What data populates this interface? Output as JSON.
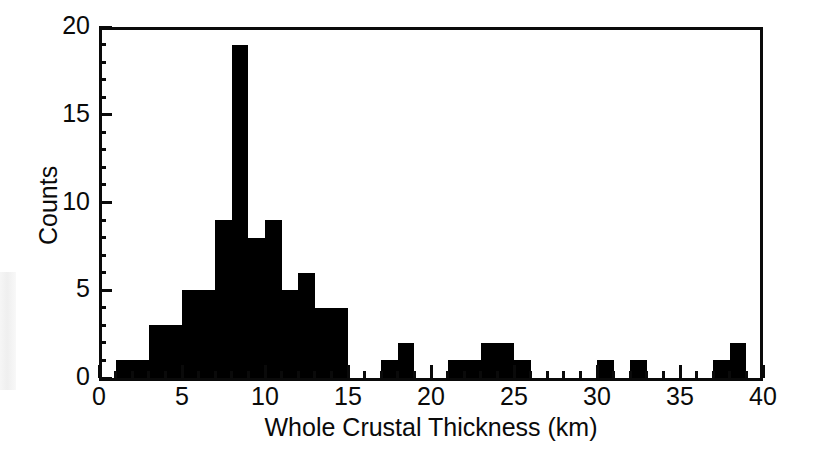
{
  "chart_data": {
    "type": "bar",
    "title": "",
    "subtitle": "",
    "xlabel": "Whole Crustal Thickness (km)",
    "ylabel": "Counts",
    "xlim": [
      0,
      40
    ],
    "ylim": [
      0,
      20
    ],
    "grid": false,
    "legend": null,
    "bin_width": 1,
    "bar_color": "#000000",
    "axis_color": "#000000",
    "background": "#ffffff",
    "xticks_major": [
      0,
      5,
      10,
      15,
      20,
      25,
      30,
      35,
      40
    ],
    "xtick_labels": [
      "0",
      "5",
      "10",
      "15",
      "20",
      "25",
      "30",
      "35",
      "40"
    ],
    "xticks_minor_step": 1,
    "yticks_major": [
      0,
      5,
      10,
      15,
      20
    ],
    "ytick_labels": [
      "0",
      "5",
      "10",
      "15",
      "20"
    ],
    "yticks_minor_step": 1,
    "bins": [
      {
        "x0": 1,
        "x1": 2,
        "value": 1
      },
      {
        "x0": 2,
        "x1": 3,
        "value": 1
      },
      {
        "x0": 3,
        "x1": 4,
        "value": 3
      },
      {
        "x0": 4,
        "x1": 5,
        "value": 3
      },
      {
        "x0": 5,
        "x1": 6,
        "value": 5
      },
      {
        "x0": 6,
        "x1": 7,
        "value": 5
      },
      {
        "x0": 7,
        "x1": 8,
        "value": 9
      },
      {
        "x0": 8,
        "x1": 9,
        "value": 19
      },
      {
        "x0": 9,
        "x1": 10,
        "value": 8
      },
      {
        "x0": 10,
        "x1": 11,
        "value": 9
      },
      {
        "x0": 11,
        "x1": 12,
        "value": 5
      },
      {
        "x0": 12,
        "x1": 13,
        "value": 6
      },
      {
        "x0": 13,
        "x1": 14,
        "value": 4
      },
      {
        "x0": 14,
        "x1": 15,
        "value": 4
      },
      {
        "x0": 17,
        "x1": 18,
        "value": 1
      },
      {
        "x0": 18,
        "x1": 19,
        "value": 2
      },
      {
        "x0": 21,
        "x1": 22,
        "value": 1
      },
      {
        "x0": 22,
        "x1": 23,
        "value": 1
      },
      {
        "x0": 23,
        "x1": 24,
        "value": 2
      },
      {
        "x0": 24,
        "x1": 25,
        "value": 2
      },
      {
        "x0": 25,
        "x1": 26,
        "value": 1
      },
      {
        "x0": 30,
        "x1": 31,
        "value": 1
      },
      {
        "x0": 32,
        "x1": 33,
        "value": 1
      },
      {
        "x0": 37,
        "x1": 38,
        "value": 1
      },
      {
        "x0": 38,
        "x1": 39,
        "value": 2
      }
    ],
    "categories": [
      "1-2",
      "2-3",
      "3-4",
      "4-5",
      "5-6",
      "6-7",
      "7-8",
      "8-9",
      "9-10",
      "10-11",
      "11-12",
      "12-13",
      "13-14",
      "14-15",
      "17-18",
      "18-19",
      "21-22",
      "22-23",
      "23-24",
      "24-25",
      "25-26",
      "30-31",
      "32-33",
      "37-38",
      "38-39"
    ],
    "values": [
      1,
      1,
      3,
      3,
      5,
      5,
      9,
      19,
      8,
      9,
      5,
      6,
      4,
      4,
      1,
      2,
      1,
      1,
      2,
      2,
      1,
      1,
      1,
      1,
      2
    ],
    "total_counts": 85,
    "peak": {
      "bin": "8-9",
      "value": 19
    }
  }
}
